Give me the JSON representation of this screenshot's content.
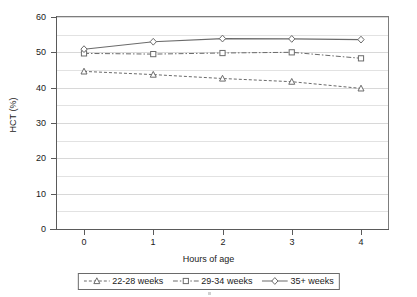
{
  "chart_data": {
    "type": "line",
    "title": "",
    "xlabel": "Hours of age",
    "ylabel": "HCT (%)",
    "x": [
      0,
      1,
      2,
      3,
      4
    ],
    "xtick_labels": [
      "0",
      "1",
      "2",
      "3",
      "4"
    ],
    "xlim": [
      0,
      4
    ],
    "ylim": [
      0,
      60
    ],
    "ytick_labels": [
      "0",
      "10",
      "20",
      "30",
      "40",
      "50",
      "60"
    ],
    "ytick_values": [
      0,
      10,
      20,
      30,
      40,
      50,
      60
    ],
    "minor_gridline_values": [
      5,
      15,
      25,
      35,
      45,
      55
    ],
    "grid": true,
    "legend_position": "bottom",
    "series": [
      {
        "name": "22-28 weeks",
        "marker": "triangle",
        "linestyle": "dotted",
        "color": "#6b6b6b",
        "values": [
          44.6,
          43.7,
          42.6,
          41.7,
          39.8
        ]
      },
      {
        "name": "29-34 weeks",
        "marker": "square",
        "linestyle": "dash-dot",
        "color": "#6b6b6b",
        "values": [
          49.7,
          49.5,
          49.8,
          50.0,
          48.3
        ]
      },
      {
        "name": "35+ weeks",
        "marker": "diamond",
        "linestyle": "solid",
        "color": "#6b6b6b",
        "values": [
          50.9,
          53.0,
          53.9,
          53.8,
          53.6
        ]
      }
    ]
  },
  "axes": {
    "y_title": "HCT (%)",
    "x_title": "Hours of age"
  },
  "legend": {
    "items": [
      {
        "label": "22-28 weeks"
      },
      {
        "label": "29-34 weeks"
      },
      {
        "label": "35+ weeks"
      }
    ]
  },
  "colors": {
    "series_line": "#6b6b6b",
    "axis": "#5a5a5a",
    "grid_major": "#d8d8d8",
    "grid_minor": "#e2e2e2",
    "text": "#1a1a1a",
    "background": "#ffffff"
  }
}
